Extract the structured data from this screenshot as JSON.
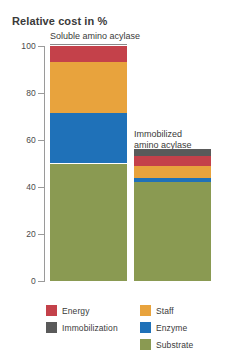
{
  "chart_data": {
    "type": "bar",
    "subtype": "stacked-bar",
    "title": "Relative cost in %",
    "xlabel": "",
    "ylabel": "Relative cost in %",
    "ylim": [
      0,
      100
    ],
    "yticks": [
      0,
      20,
      40,
      60,
      80,
      100
    ],
    "ytick_labels": [
      "0",
      "20",
      "40",
      "60",
      "80",
      "100"
    ],
    "grid": false,
    "legend_position": "bottom",
    "categories": [
      "Soluble amino acylase",
      "Immobilized amino acylase"
    ],
    "series": [
      {
        "name": "Substrate",
        "color": "#8a9a52",
        "values": [
          50.0,
          42.0
        ]
      },
      {
        "name": "Enzyme",
        "color": "#1f71b8",
        "values": [
          21.5,
          2.0
        ]
      },
      {
        "name": "Staff",
        "color": "#e8a33d",
        "values": [
          21.5,
          5.0
        ]
      },
      {
        "name": "Energy",
        "color": "#c4414a",
        "values": [
          7.0,
          4.0
        ]
      },
      {
        "name": "Immobilization",
        "color": "#5a5a5a",
        "values": [
          0.0,
          3.0
        ]
      }
    ],
    "totals": [
      100.0,
      56.0
    ],
    "legend": [
      {
        "label": "Energy",
        "color": "#c4414a"
      },
      {
        "label": "Staff",
        "color": "#e8a33d"
      },
      {
        "label": "Immobilization",
        "color": "#5a5a5a"
      },
      {
        "label": "Enzyme",
        "color": "#1f71b8"
      },
      {
        "label": "Substrate",
        "color": "#8a9a52"
      }
    ],
    "annotations": [
      {
        "text": "Soluble amino acylase",
        "target": "bar-1"
      },
      {
        "text": "Immobilized amino acylase",
        "target": "bar-2"
      }
    ]
  },
  "bars": [
    {
      "id": "soluble",
      "label_line1": "Soluble amino acylase",
      "label_line2": "",
      "total": 100.0,
      "segments": [
        {
          "name": "Energy",
          "value": 7.0,
          "color": "#c4414a",
          "from": 93.0,
          "to": 100.0
        },
        {
          "name": "Staff",
          "value": 21.5,
          "color": "#e8a33d",
          "from": 71.5,
          "to": 93.0
        },
        {
          "name": "Enzyme",
          "value": 21.5,
          "color": "#1f71b8",
          "from": 50.0,
          "to": 71.5
        },
        {
          "name": "Substrate",
          "value": 50.0,
          "color": "#8a9a52",
          "from": 0.0,
          "to": 50.0
        }
      ]
    },
    {
      "id": "immobilized",
      "label_line1": "Immobilized",
      "label_line2": "amino acylase",
      "total": 56.0,
      "segments": [
        {
          "name": "Immobilization",
          "value": 3.0,
          "color": "#5a5a5a",
          "from": 53.0,
          "to": 56.0
        },
        {
          "name": "Energy",
          "value": 4.0,
          "color": "#c4414a",
          "from": 49.0,
          "to": 53.0
        },
        {
          "name": "Staff",
          "value": 5.0,
          "color": "#e8a33d",
          "from": 44.0,
          "to": 49.0
        },
        {
          "name": "Enzyme",
          "value": 2.0,
          "color": "#1f71b8",
          "from": 42.0,
          "to": 44.0
        },
        {
          "name": "Substrate",
          "value": 42.0,
          "color": "#8a9a52",
          "from": 0.0,
          "to": 42.0
        }
      ]
    }
  ],
  "axis": {
    "title": "Relative cost in %",
    "tick_labels": [
      "100",
      "80",
      "60",
      "40",
      "20",
      "0"
    ],
    "tick_values": [
      100,
      80,
      60,
      40,
      20,
      0
    ]
  }
}
